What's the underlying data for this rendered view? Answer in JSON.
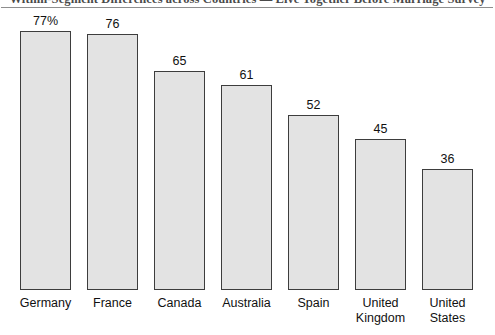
{
  "header": {
    "title": "Within-Segment Differences across Countries — Live Together Before Marriage Survey"
  },
  "chart_data": {
    "type": "bar",
    "title": "Within-Segment Differences across Countries — Live Together Before Marriage Survey",
    "xlabel": "",
    "ylabel": "",
    "ylim": [
      0,
      80
    ],
    "grid": false,
    "legend": "none",
    "categories": [
      "Germany",
      "France",
      "Canada",
      "Australia",
      "Spain",
      "United\nKingdom",
      "United\nStates"
    ],
    "values": [
      77,
      76,
      65,
      61,
      52,
      45,
      36
    ],
    "data_labels": [
      "77%",
      "76",
      "65",
      "61",
      "52",
      "45",
      "36"
    ],
    "bar_fill_color": "#e3e3e3",
    "bar_border_color": "#3d3d3d",
    "background_color": "#ffffff"
  }
}
